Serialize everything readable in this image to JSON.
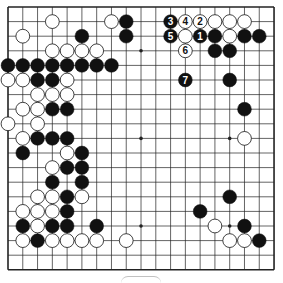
{
  "board": {
    "size": 19,
    "origin_x": 8,
    "origin_y": 7,
    "spacing_x": 14.78,
    "spacing_y": 14.6,
    "line_color": "#222222",
    "black_color": "#111111",
    "white_color": "#ffffff",
    "star_points": [
      [
        3,
        9
      ],
      [
        9,
        9
      ],
      [
        15,
        9
      ],
      [
        15,
        15
      ],
      [
        3,
        3
      ],
      [
        3,
        15
      ],
      [
        9,
        3
      ],
      [
        9,
        15
      ],
      [
        15,
        3
      ]
    ]
  },
  "stones": {
    "black": [
      [
        8,
        1
      ],
      [
        8,
        2
      ],
      [
        5,
        2
      ],
      [
        14,
        2
      ],
      [
        16,
        2
      ],
      [
        17,
        2
      ],
      [
        14,
        3
      ],
      [
        15,
        3
      ],
      [
        15,
        5
      ],
      [
        16,
        7
      ],
      [
        0,
        4
      ],
      [
        1,
        4
      ],
      [
        2,
        4
      ],
      [
        3,
        4
      ],
      [
        4,
        4
      ],
      [
        5,
        4
      ],
      [
        6,
        4
      ],
      [
        7,
        4
      ],
      [
        2,
        5
      ],
      [
        3,
        5
      ],
      [
        3,
        7
      ],
      [
        4,
        7
      ],
      [
        2,
        9
      ],
      [
        3,
        9
      ],
      [
        4,
        9
      ],
      [
        1,
        10
      ],
      [
        5,
        10
      ],
      [
        4,
        11
      ],
      [
        5,
        11
      ],
      [
        3,
        12
      ],
      [
        5,
        12
      ],
      [
        4,
        13
      ],
      [
        4,
        14
      ],
      [
        1,
        15
      ],
      [
        3,
        15
      ],
      [
        4,
        15
      ],
      [
        6,
        15
      ],
      [
        2,
        16
      ],
      [
        15,
        13
      ],
      [
        13,
        14
      ],
      [
        16,
        15
      ],
      [
        17,
        16
      ]
    ],
    "white": [
      [
        3,
        1
      ],
      [
        7,
        1
      ],
      [
        14,
        1
      ],
      [
        15,
        1
      ],
      [
        16,
        1
      ],
      [
        1,
        2
      ],
      [
        15,
        2
      ],
      [
        3,
        3
      ],
      [
        4,
        3
      ],
      [
        5,
        3
      ],
      [
        6,
        3
      ],
      [
        0,
        5
      ],
      [
        1,
        5
      ],
      [
        4,
        5
      ],
      [
        2,
        6
      ],
      [
        3,
        6
      ],
      [
        4,
        6
      ],
      [
        1,
        7
      ],
      [
        2,
        7
      ],
      [
        0,
        8
      ],
      [
        2,
        8
      ],
      [
        1,
        9
      ],
      [
        4,
        10
      ],
      [
        3,
        11
      ],
      [
        2,
        13
      ],
      [
        3,
        13
      ],
      [
        5,
        13
      ],
      [
        1,
        14
      ],
      [
        2,
        14
      ],
      [
        3,
        14
      ],
      [
        2,
        15
      ],
      [
        1,
        16
      ],
      [
        3,
        16
      ],
      [
        4,
        16
      ],
      [
        5,
        16
      ],
      [
        6,
        16
      ],
      [
        8,
        16
      ],
      [
        16,
        9
      ],
      [
        14,
        15
      ],
      [
        15,
        16
      ],
      [
        16,
        16
      ]
    ],
    "numbered": [
      {
        "x": 13,
        "y": 2,
        "color": "black",
        "label": "1"
      },
      {
        "x": 13,
        "y": 1,
        "color": "white",
        "label": "2"
      },
      {
        "x": 11,
        "y": 1,
        "color": "black",
        "label": "3"
      },
      {
        "x": 12,
        "y": 1,
        "color": "white",
        "label": "4"
      },
      {
        "x": 11,
        "y": 2,
        "color": "black",
        "label": "5"
      },
      {
        "x": 12,
        "y": 2,
        "color": "white",
        "label": ""
      },
      {
        "x": 12,
        "y": 3,
        "color": "white",
        "label": "6"
      },
      {
        "x": 12,
        "y": 5,
        "color": "black",
        "label": "7"
      }
    ]
  }
}
